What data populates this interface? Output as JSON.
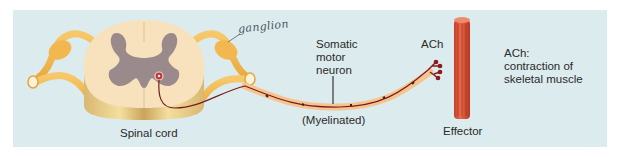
{
  "diagram": {
    "labels": {
      "spinal_cord": "Spinal cord",
      "ganglion_annotation": "ganglion",
      "neuron_line1": "Somatic",
      "neuron_line2": "motor",
      "neuron_line3": "neuron",
      "myelinated": "(Myelinated)",
      "neurotransmitter": "ACh",
      "effector": "Effector",
      "effect_line1": "ACh:",
      "effect_line2": "contraction of",
      "effect_line3": "skeletal muscle"
    },
    "colors": {
      "background": "#dcebed",
      "nerve": "#f2b84f",
      "white_matter": "#f7e2bd",
      "gray_matter": "#9b8a8c",
      "axon": "#7a1c1c",
      "myelin": "#f6c58f",
      "muscle": "#d9533a"
    }
  }
}
